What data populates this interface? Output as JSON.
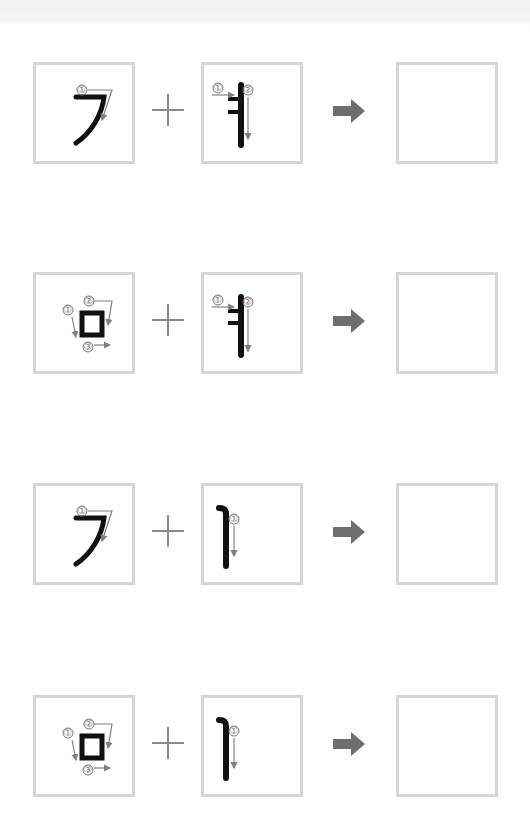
{
  "worksheet": {
    "type": "Hangul stroke-order combination practice",
    "operator_plus": "+",
    "operator_arrow": "right-arrow-icon",
    "colors": {
      "box_border": "#d6d6d6",
      "stroke_ink": "#111111",
      "guide_arrow": "#808080",
      "operator": "#8a8a8a"
    },
    "rows": [
      {
        "consonant": "ㄱ",
        "consonant_strokes": [
          "①"
        ],
        "vowel": "ㅕ",
        "vowel_strokes": [
          "①",
          "②"
        ],
        "answer": ""
      },
      {
        "consonant": "ㅁ",
        "consonant_strokes": [
          "①",
          "②",
          "③"
        ],
        "vowel": "ㅕ",
        "vowel_strokes": [
          "①",
          "②"
        ],
        "answer": ""
      },
      {
        "consonant": "ㄱ",
        "consonant_strokes": [
          "①"
        ],
        "vowel": "ㅣ",
        "vowel_strokes": [
          "①"
        ],
        "answer": ""
      },
      {
        "consonant": "ㅁ",
        "consonant_strokes": [
          "①",
          "②",
          "③"
        ],
        "vowel": "ㅣ",
        "vowel_strokes": [
          "①"
        ],
        "answer": ""
      }
    ]
  }
}
